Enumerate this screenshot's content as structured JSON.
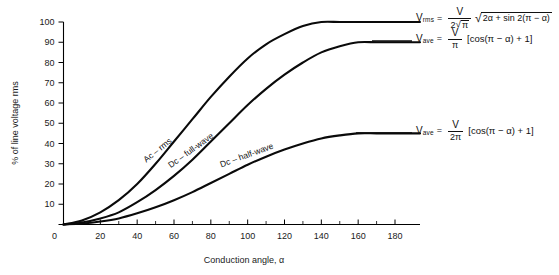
{
  "chart_data": {
    "type": "line",
    "title": "",
    "xlabel": "Conduction angle, α",
    "ylabel": "% of line voltage rms",
    "xlim": [
      0,
      190
    ],
    "ylim": [
      0,
      100
    ],
    "grid": false,
    "legend_position": "inline-curve-labels",
    "x_ticks": [
      0,
      20,
      40,
      60,
      80,
      100,
      120,
      140,
      160,
      180
    ],
    "x_minor_ticks": [
      10,
      30,
      50,
      70,
      90,
      110,
      130,
      150,
      170
    ],
    "y_ticks": [
      0,
      10,
      20,
      30,
      40,
      50,
      60,
      70,
      80,
      90,
      100
    ],
    "x": [
      0,
      10,
      20,
      30,
      40,
      50,
      60,
      70,
      80,
      90,
      100,
      110,
      120,
      130,
      140,
      150,
      160,
      170,
      180
    ],
    "series": [
      {
        "name": "Ac — rms",
        "label": "Ac – rms",
        "values": [
          0,
          2,
          6,
          12,
          20,
          30,
          41,
          52,
          63,
          73,
          82,
          89,
          94,
          98,
          100,
          100,
          100,
          100,
          100
        ]
      },
      {
        "name": "Dc — full-wave",
        "label": "Dc – full-wave",
        "values": [
          0,
          1,
          3,
          6,
          11,
          17,
          24,
          32,
          41,
          50,
          59,
          67,
          74,
          80,
          85,
          88,
          90,
          90,
          90
        ]
      },
      {
        "name": "Dc — half-wave",
        "label": "Dc – half-wave",
        "values": [
          0,
          0.5,
          1.5,
          3,
          5.5,
          8.5,
          12,
          16,
          20.5,
          25,
          29.5,
          33.5,
          37,
          40,
          42.5,
          44,
          45,
          45,
          45
        ]
      }
    ],
    "annotations": [
      {
        "id": "formula-rms",
        "variable": "V",
        "subscript": "rms",
        "equals": "=",
        "numerator": "V",
        "denominator": "2√π",
        "radicand": "2α + sin 2(π − α)",
        "text": "V_rms = V / (2√π) · √(2α + sin 2(π − α))"
      },
      {
        "id": "formula-ave-full",
        "variable": "V",
        "subscript": "ave",
        "equals": "=",
        "numerator": "V",
        "denominator": "π",
        "bracket": "[cos(π − α) + 1]",
        "text": "V_ave = V / π [cos(π − α) + 1]"
      },
      {
        "id": "formula-ave-half",
        "variable": "V",
        "subscript": "ave",
        "equals": "=",
        "numerator": "V",
        "denominator": "2π",
        "bracket": "[cos(π − α) + 1]",
        "text": "V_ave = V / (2π) [cos(π − α) + 1]"
      }
    ],
    "colors": {
      "curve": "#0a0a0a",
      "axis": "#000000",
      "text": "#1a1a1a",
      "background": "#ffffff"
    }
  }
}
